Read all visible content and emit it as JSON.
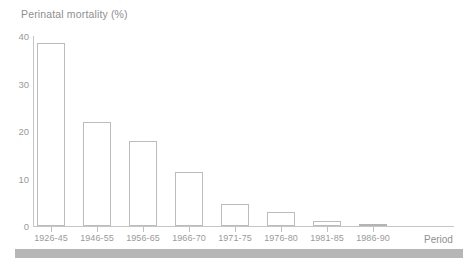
{
  "chart_data": {
    "type": "bar",
    "title": "Perinatal mortality (%)",
    "xlabel": "Period",
    "ylabel": "Perinatal mortality (%)",
    "categories": [
      "1926-45",
      "1946-55",
      "1956-65",
      "1966-70",
      "1971-75",
      "1976-80",
      "1981-85",
      "1986-90"
    ],
    "values": [
      38.5,
      22.0,
      18.0,
      11.4,
      4.7,
      3.0,
      1.0,
      0.5
    ],
    "ylim": [
      0,
      40
    ],
    "yticks": [
      0,
      10,
      20,
      30,
      40
    ],
    "ytick_labels": [
      "0",
      "10",
      "20",
      "30",
      "40"
    ],
    "grid": false,
    "legend": null,
    "series": [
      {
        "name": "Perinatal mortality (%)",
        "values": [
          38.5,
          22.0,
          18.0,
          11.4,
          4.7,
          3.0,
          1.0,
          0.5
        ]
      }
    ],
    "bar_style": {
      "outline_color": "#bcbcbc",
      "fill_color": "transparent",
      "last_bar_fill": "#c9c9c9"
    }
  },
  "axes": {
    "y_axis_color": "#c6c6c6",
    "x_axis_color": "#c6c6c6",
    "tick_label_color": "#9a9a9a"
  },
  "labels": {
    "title": "Perinatal mortality (%)",
    "x_axis_title": "Period"
  }
}
